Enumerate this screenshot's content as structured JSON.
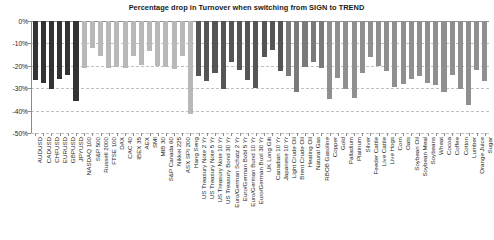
{
  "chart": {
    "title": "Percentage drop in Turnover when switching from SIGN to TREND",
    "ylabel": "",
    "xlabel": ""
  },
  "axis": {
    "yticks": [
      "0%",
      "-10%",
      "-20%",
      "-30%",
      "-40%",
      "-50%"
    ]
  },
  "colors": {
    "fx": "#333333",
    "equity": "#b8b8b8",
    "bond": "#555555",
    "energy": "#7a7a7a",
    "metal": "#8f8f8f",
    "ags": "#8f8f8f",
    "grid": "#bfbfbf",
    "axis": "#8c8c8c",
    "text": "#1a1a1a"
  },
  "chart_data": {
    "type": "bar",
    "title": "Percentage drop in Turnover when switching from SIGN to TREND",
    "xlabel": "",
    "ylabel": "",
    "ylim": [
      -50,
      0
    ],
    "yticks": [
      0,
      -10,
      -20,
      -30,
      -40,
      -50
    ],
    "grid": true,
    "legend": "none",
    "orientation": "vertical",
    "units": "percent",
    "categories": [
      "AUDUSD",
      "CADUSD",
      "CHFUSD",
      "EURUSD",
      "GBPUSD",
      "JPYUSD",
      "NASDAQ 100",
      "S&P 500",
      "Russell 2000",
      "FTSE 100",
      "DAX",
      "CAC 40",
      "IBEX 35",
      "AEX",
      "SMI",
      "MIB 30",
      "S&P Canada 60",
      "Nikkei 225",
      "ASX SPI 200",
      "Hang Seng",
      "US Treasury Note 2 Yr",
      "US Treasury Note 5 Yr",
      "US Treasury Note 10 Yr",
      "US Treasury Bond 30 Yr",
      "Euro/German Schatz 2 Yr",
      "Euro/German Bobl 5 Yr",
      "Euro/German Bund 10 Yr",
      "Euro/German Buxl 30 Yr",
      "UK Long Gilt",
      "Canadian 10 Yr",
      "Japanese 10 Yr",
      "Light Crude Oil",
      "Brent Crude Oil",
      "Heating Oil",
      "Natural Gas",
      "RBOB Gasoline",
      "Copper",
      "Gold",
      "Palladium",
      "Platinum",
      "Silver",
      "Feeder Cattle",
      "Live Cattle",
      "Live Hogs",
      "Corn",
      "Oats",
      "Soybean Oil",
      "Soybean Meal",
      "Soybeans",
      "Wheat",
      "Cocoa",
      "Coffee",
      "Cotton",
      "Lumber",
      "Orange Juice",
      "Sugar"
    ],
    "values": [
      -26.5,
      -27.5,
      -30.5,
      -26.0,
      -24.0,
      -35.5,
      -21.0,
      -12.0,
      -15.5,
      -21.0,
      -20.5,
      -21.0,
      -15.5,
      -19.5,
      -13.5,
      -20.0,
      -20.5,
      -21.5,
      -15.5,
      -41.5,
      -24.5,
      -27.0,
      -23.0,
      -30.5,
      -18.5,
      -22.0,
      -26.5,
      -30.0,
      -16.0,
      -13.0,
      -22.5,
      -24.5,
      -31.5,
      -20.5,
      -18.5,
      -21.0,
      -35.0,
      -25.5,
      -30.5,
      -34.5,
      -23.0,
      -16.0,
      -20.0,
      -22.5,
      -29.5,
      -28.0,
      -26.0,
      -24.5,
      -27.5,
      -28.5,
      -31.5,
      -24.0,
      -30.5,
      -37.5,
      -22.0,
      -27.0
    ],
    "groups": [
      "fx",
      "fx",
      "fx",
      "fx",
      "fx",
      "fx",
      "equity",
      "equity",
      "equity",
      "equity",
      "equity",
      "equity",
      "equity",
      "equity",
      "equity",
      "equity",
      "equity",
      "equity",
      "equity",
      "equity",
      "bond",
      "bond",
      "bond",
      "bond",
      "bond",
      "bond",
      "bond",
      "bond",
      "bond",
      "bond",
      "bond",
      "energy",
      "energy",
      "energy",
      "energy",
      "energy",
      "metal",
      "metal",
      "metal",
      "metal",
      "metal",
      "ags",
      "ags",
      "ags",
      "ags",
      "ags",
      "ags",
      "ags",
      "ags",
      "ags",
      "ags",
      "ags",
      "ags",
      "ags",
      "ags",
      "ags"
    ]
  }
}
